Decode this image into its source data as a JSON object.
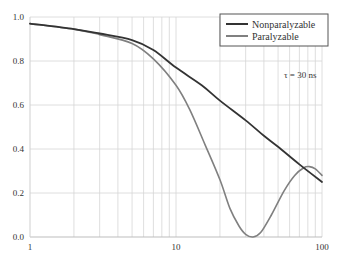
{
  "chart_data": {
    "type": "line",
    "title": "",
    "xlabel": "",
    "ylabel": "",
    "xscale": "log",
    "xlim": [
      1,
      100
    ],
    "ylim": [
      0.0,
      1.0
    ],
    "grid": true,
    "x_ticks": [
      {
        "value": 1,
        "label": "1"
      },
      {
        "value": 10,
        "label": "10"
      },
      {
        "value": 100,
        "label": "100"
      }
    ],
    "y_ticks": [
      {
        "value": 0.0,
        "label": "0.0"
      },
      {
        "value": 0.2,
        "label": "0.2"
      },
      {
        "value": 0.4,
        "label": "0.4"
      },
      {
        "value": 0.6,
        "label": "0.6"
      },
      {
        "value": 0.8,
        "label": "0.8"
      },
      {
        "value": 1.0,
        "label": "1.0"
      }
    ],
    "legend_position": "top-right",
    "annotation": "τ = 30 ns",
    "series": [
      {
        "name": "Nonparalyzable",
        "color": "#333333",
        "x": [
          1,
          2,
          3,
          5,
          7,
          10,
          15,
          20,
          30,
          40,
          50,
          70,
          100
        ],
        "y": [
          0.97,
          0.945,
          0.925,
          0.895,
          0.85,
          0.77,
          0.69,
          0.62,
          0.53,
          0.46,
          0.41,
          0.33,
          0.25
        ]
      },
      {
        "name": "Paralyzable",
        "color": "#808080",
        "x": [
          1,
          2,
          3,
          5,
          7,
          10,
          12.4,
          15.8,
          20,
          23.4,
          27,
          30,
          33.7,
          38,
          45,
          55,
          65,
          75,
          82,
          90,
          100
        ],
        "y": [
          0.97,
          0.945,
          0.92,
          0.88,
          0.81,
          0.69,
          0.58,
          0.42,
          0.26,
          0.13,
          0.05,
          0.012,
          0.0,
          0.02,
          0.1,
          0.21,
          0.28,
          0.315,
          0.32,
          0.31,
          0.28
        ]
      }
    ]
  }
}
